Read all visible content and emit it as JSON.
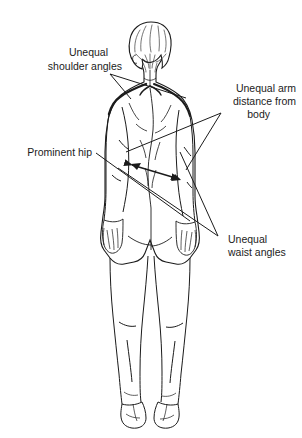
{
  "figure": {
    "background_color": "#ffffff",
    "line_color": "#1b1b1b",
    "shading_color": "#d6d6d6",
    "text_color": "#1b1b1b"
  },
  "annotations": {
    "shoulder_angles": {
      "name": "unequal-shoulder-angles",
      "line1": "Unequal",
      "line2": "shoulder angles"
    },
    "arm_distance": {
      "name": "unequal-arm-distance",
      "line1": "Unequal arm",
      "line2": "distance from",
      "line3": "body"
    },
    "prominent_hip": {
      "name": "prominent-hip",
      "line1": "Prominent hip"
    },
    "waist_angles": {
      "name": "unequal-waist-angles",
      "line1": "Unequal",
      "line2": "waist angles"
    }
  }
}
